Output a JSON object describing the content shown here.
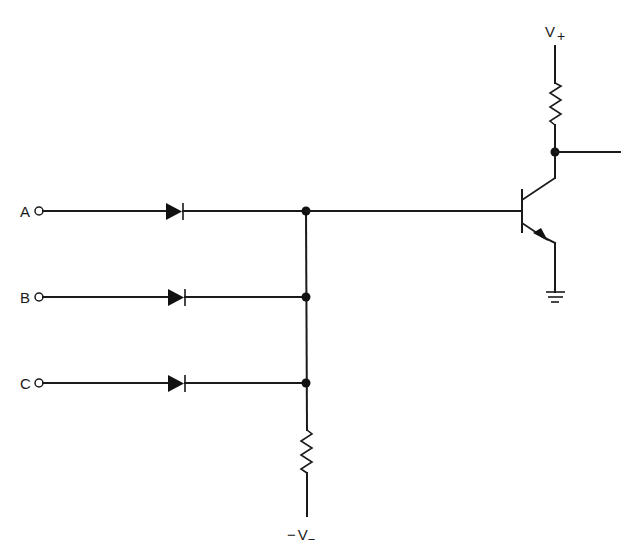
{
  "diagram": {
    "type": "circuit-schematic",
    "colors": {
      "ink": "#1a1a1a",
      "background": "#ffffff"
    },
    "inputs": [
      {
        "label": "A",
        "y": 211
      },
      {
        "label": "B",
        "y": 297
      },
      {
        "label": "C",
        "y": 383
      }
    ],
    "supply_positive": {
      "label": "V",
      "subscript": "+"
    },
    "supply_negative": {
      "prefix": "−",
      "label": "V",
      "subscript": "−"
    },
    "components": [
      {
        "id": "D1",
        "kind": "diode",
        "input": "A"
      },
      {
        "id": "D2",
        "kind": "diode",
        "input": "B"
      },
      {
        "id": "D3",
        "kind": "diode",
        "input": "C"
      },
      {
        "id": "R1",
        "kind": "resistor",
        "role": "pull-down to -V"
      },
      {
        "id": "R2",
        "kind": "resistor",
        "role": "collector load to V+"
      },
      {
        "id": "Q1",
        "kind": "npn-transistor"
      },
      {
        "id": "GND",
        "kind": "ground"
      }
    ],
    "output": {
      "label": ""
    }
  }
}
